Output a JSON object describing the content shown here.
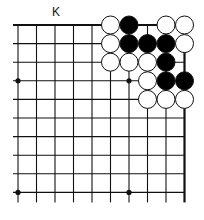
{
  "board": {
    "column_label": "K",
    "columns": 10,
    "rows": 10,
    "grid": {
      "x0": 18,
      "y0": 25,
      "dx": 18.5,
      "dy": 18.6
    },
    "edges": {
      "top": true,
      "right": true,
      "left": false,
      "bottom": false
    },
    "star_points": [
      [
        0,
        3
      ],
      [
        6,
        3
      ],
      [
        0,
        9
      ],
      [
        6,
        9
      ]
    ],
    "stones": [
      {
        "col": 5,
        "row": 0,
        "color": "white"
      },
      {
        "col": 6,
        "row": 0,
        "color": "black"
      },
      {
        "col": 8,
        "row": 0,
        "color": "white"
      },
      {
        "col": 9,
        "row": 0,
        "color": "white"
      },
      {
        "col": 5,
        "row": 1,
        "color": "white"
      },
      {
        "col": 6,
        "row": 1,
        "color": "black"
      },
      {
        "col": 7,
        "row": 1,
        "color": "black"
      },
      {
        "col": 8,
        "row": 1,
        "color": "black"
      },
      {
        "col": 9,
        "row": 1,
        "color": "white"
      },
      {
        "col": 5,
        "row": 2,
        "color": "white"
      },
      {
        "col": 6,
        "row": 2,
        "color": "white"
      },
      {
        "col": 7,
        "row": 2,
        "color": "white"
      },
      {
        "col": 8,
        "row": 2,
        "color": "black"
      },
      {
        "col": 7,
        "row": 3,
        "color": "white"
      },
      {
        "col": 8,
        "row": 3,
        "color": "black"
      },
      {
        "col": 9,
        "row": 3,
        "color": "black"
      },
      {
        "col": 7,
        "row": 4,
        "color": "white"
      },
      {
        "col": 8,
        "row": 4,
        "color": "white"
      },
      {
        "col": 9,
        "row": 4,
        "color": "white"
      }
    ]
  }
}
